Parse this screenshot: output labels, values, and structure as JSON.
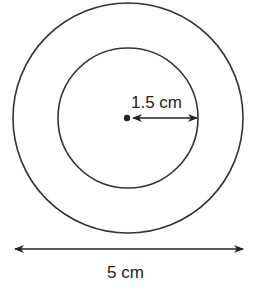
{
  "diagram": {
    "type": "concentric-circles",
    "outer_circle": {
      "diameter_label": "5 cm"
    },
    "inner_circle": {
      "radius_label": "1.5 cm"
    },
    "colors": {
      "stroke": "#333333",
      "background": "#ffffff"
    }
  }
}
